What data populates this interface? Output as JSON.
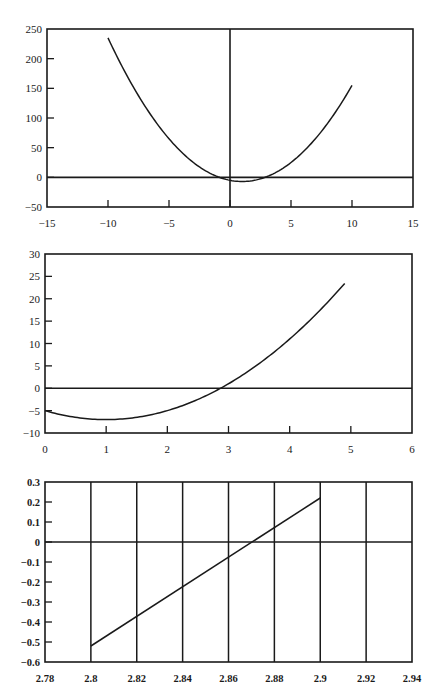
{
  "chart_data": [
    {
      "type": "line",
      "title": "",
      "xlabel": "",
      "ylabel": "",
      "xlim": [
        -15,
        15
      ],
      "ylim": [
        -50,
        250
      ],
      "x_ticks": [
        "-15",
        "-10",
        "-5",
        "0",
        "5",
        "10",
        "15"
      ],
      "x_tick_values": [
        -15,
        -10,
        -5,
        0,
        5,
        10,
        15
      ],
      "y_ticks": [
        "250",
        "200",
        "150",
        "100",
        "50",
        "0",
        "-50"
      ],
      "y_tick_values": [
        250,
        200,
        150,
        100,
        50,
        0,
        -50
      ],
      "grid": false,
      "reference_lines": {
        "horizontal_y": 0,
        "vertical_x": 0
      },
      "series": [
        {
          "name": "f(x) = 2x^2 - 4x - 5",
          "x": [
            -10,
            -8,
            -6,
            -4,
            -2,
            0,
            1,
            2,
            4,
            6,
            8,
            10
          ],
          "y": [
            235,
            155,
            91,
            43,
            11,
            -5,
            -7,
            -5,
            11,
            43,
            91,
            155
          ]
        }
      ]
    },
    {
      "type": "line",
      "title": "",
      "xlabel": "",
      "ylabel": "",
      "xlim": [
        0,
        6
      ],
      "ylim": [
        -10,
        30
      ],
      "x_ticks": [
        "0",
        "1",
        "2",
        "3",
        "4",
        "5",
        "6"
      ],
      "x_tick_values": [
        0,
        1,
        2,
        3,
        4,
        5,
        6
      ],
      "y_ticks": [
        "30",
        "25",
        "20",
        "15",
        "10",
        "5",
        "0",
        "-5",
        "-10"
      ],
      "y_tick_values": [
        30,
        25,
        20,
        15,
        10,
        5,
        0,
        -5,
        -10
      ],
      "grid": false,
      "reference_lines": {
        "horizontal_y": 0
      },
      "series": [
        {
          "name": "f(x) = 2x^2 - 4x - 5",
          "x": [
            0,
            0.5,
            1,
            1.5,
            2,
            2.5,
            3,
            3.5,
            4,
            4.5,
            4.9
          ],
          "y": [
            -5,
            -6.5,
            -7,
            -6.5,
            -5,
            -2.5,
            1,
            5.5,
            11,
            17.5,
            23.42
          ]
        }
      ]
    },
    {
      "type": "line",
      "title": "",
      "xlabel": "",
      "ylabel": "",
      "xlim": [
        2.78,
        2.94
      ],
      "ylim": [
        -0.6,
        0.3
      ],
      "x_ticks": [
        "2.78",
        "2.8",
        "2.82",
        "2.84",
        "2.86",
        "2.88",
        "2.9",
        "2.92",
        "2.94"
      ],
      "x_tick_values": [
        2.78,
        2.8,
        2.82,
        2.84,
        2.86,
        2.88,
        2.9,
        2.92,
        2.94
      ],
      "y_ticks": [
        "0.3",
        "0.2",
        "0.1",
        "0",
        "-0.1",
        "-0.2",
        "-0.3",
        "-0.4",
        "-0.5",
        "-0.6"
      ],
      "y_tick_values": [
        0.3,
        0.2,
        0.1,
        0,
        -0.1,
        -0.2,
        -0.3,
        -0.4,
        -0.5,
        -0.6
      ],
      "grid": true,
      "grid_vertical_at": [
        2.8,
        2.82,
        2.84,
        2.86,
        2.88,
        2.9,
        2.92
      ],
      "reference_lines": {
        "horizontal_y": 0
      },
      "series": [
        {
          "name": "f(x) = 2x^2 - 4x - 5",
          "x": [
            2.8,
            2.9
          ],
          "y": [
            -0.52,
            0.22
          ]
        }
      ]
    }
  ]
}
